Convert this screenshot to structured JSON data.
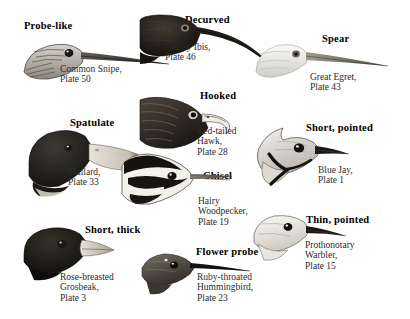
{
  "plate": {
    "background": "#fefefe",
    "ink": "#000000",
    "caption_color": "#2b2b2b",
    "medium": "grayscale engraving"
  },
  "entries": [
    {
      "id": "probe-like",
      "heading": "Probe-like",
      "species": "Common Snipe",
      "plate_label": "Plate 50",
      "caption": "Common Snipe,\nPlate 50",
      "bill_type": "long straight probing bill",
      "head_tone": "streaked brown and white",
      "heading_pos": {
        "x": 24,
        "y": 20
      },
      "caption_pos": {
        "x": 60,
        "y": 64
      },
      "art_pos": {
        "x": 22,
        "y": 38
      }
    },
    {
      "id": "decurved",
      "heading": "Decurved",
      "species": "Glossy Ibis",
      "plate_label": "Plate 46",
      "caption": "Glossy Ibis,\nPlate 46",
      "bill_type": "long downcurved bill",
      "head_tone": "very dark brown-black",
      "heading_pos": {
        "x": 185,
        "y": 14
      },
      "caption_pos": {
        "x": 165,
        "y": 42
      },
      "art_pos": {
        "x": 140,
        "y": 14
      }
    },
    {
      "id": "spear",
      "heading": "Spear",
      "species": "Great Egret",
      "plate_label": "Plate 43",
      "caption": "Great Egret,\nPlate 43",
      "bill_type": "straight dagger bill",
      "head_tone": "white with pale grey shading",
      "heading_pos": {
        "x": 322,
        "y": 33
      },
      "caption_pos": {
        "x": 310,
        "y": 72
      },
      "art_pos": {
        "x": 256,
        "y": 42
      }
    },
    {
      "id": "hooked",
      "heading": "Hooked",
      "species": "Red-tailed Hawk",
      "plate_label": "Plate 28",
      "caption": "Red-tailed\nHawk,\nPlate 28",
      "bill_type": "short hooked raptor bill",
      "head_tone": "dark streaked brown",
      "heading_pos": {
        "x": 200,
        "y": 90
      },
      "caption_pos": {
        "x": 197,
        "y": 126
      },
      "art_pos": {
        "x": 140,
        "y": 96
      }
    },
    {
      "id": "spatulate",
      "heading": "Spatulate",
      "species": "Mallard",
      "plate_label": "Plate 33",
      "caption": "Mallard,\nPlate 33",
      "bill_type": "broad flat spatulate bill",
      "head_tone": "dark iridescent green-black",
      "heading_pos": {
        "x": 70,
        "y": 117
      },
      "caption_pos": {
        "x": 68,
        "y": 167
      },
      "art_pos": {
        "x": 25,
        "y": 128
      }
    },
    {
      "id": "short-pointed",
      "heading": "Short, pointed",
      "species": "Blue Jay",
      "plate_label": "Plate 1",
      "caption": "Blue Jay,\nPlate 1",
      "bill_type": "short pointed bill",
      "head_tone": "pale grey with black collar stripe",
      "heading_pos": {
        "x": 306,
        "y": 122
      },
      "caption_pos": {
        "x": 318,
        "y": 165
      },
      "art_pos": {
        "x": 253,
        "y": 126
      }
    },
    {
      "id": "chisel",
      "heading": "Chisel",
      "species": "Hairy Woodpecker",
      "plate_label": "Plate 19",
      "caption": "Hairy\nWoodpecker,\nPlate 19",
      "bill_type": "straight chisel bill",
      "head_tone": "bold black and white stripes",
      "heading_pos": {
        "x": 203,
        "y": 170
      },
      "caption_pos": {
        "x": 198,
        "y": 196
      },
      "art_pos": {
        "x": 120,
        "y": 152
      }
    },
    {
      "id": "short-thick",
      "heading": "Short, thick",
      "species": "Rose-breasted Grosbeak",
      "plate_label": "Plate 3",
      "caption": "Rose-breasted\nGrosbeak,\nPlate 3",
      "bill_type": "short thick conical bill",
      "head_tone": "solid black",
      "heading_pos": {
        "x": 85,
        "y": 224
      },
      "caption_pos": {
        "x": 60,
        "y": 272
      },
      "art_pos": {
        "x": 22,
        "y": 226
      }
    },
    {
      "id": "flower-probe",
      "heading": "Flower probe",
      "species": "Ruby-throated Hummingbird",
      "plate_label": "Plate 23",
      "caption": "Ruby-throated\nHummingbird,\nPlate 23",
      "bill_type": "long needle-like bill",
      "head_tone": "grey-green",
      "heading_pos": {
        "x": 196,
        "y": 246
      },
      "caption_pos": {
        "x": 197,
        "y": 272
      },
      "art_pos": {
        "x": 140,
        "y": 252
      }
    },
    {
      "id": "thin-pointed",
      "heading": "Thin, pointed",
      "species": "Prothonotary Warbler",
      "plate_label": "Plate 15",
      "caption": "Prothonotary\nWarbler,\nPlate 15",
      "bill_type": "thin pointed bill",
      "head_tone": "pale cream",
      "heading_pos": {
        "x": 306,
        "y": 214
      },
      "caption_pos": {
        "x": 305,
        "y": 240
      },
      "art_pos": {
        "x": 252,
        "y": 214
      }
    }
  ]
}
